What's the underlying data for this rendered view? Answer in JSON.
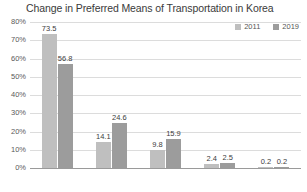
{
  "chart_data": {
    "type": "bar",
    "title": "Change in Preferred Means of Transportation in Korea",
    "xlabel": "",
    "ylabel": "",
    "categories": [
      "Car",
      "Bus",
      "Train",
      "Airplane",
      "Ship"
    ],
    "series": [
      {
        "name": "2011",
        "color": "#bfbfbf",
        "values": [
          73.5,
          14.1,
          9.8,
          2.4,
          0.2
        ]
      },
      {
        "name": "2019",
        "color": "#9c9c9c",
        "values": [
          56.8,
          24.6,
          15.9,
          2.5,
          0.2
        ]
      }
    ],
    "ylim": [
      0,
      80
    ],
    "yticks": [
      "0%",
      "10%",
      "20%",
      "30%",
      "40%",
      "50%",
      "60%",
      "70%",
      "80%"
    ],
    "ytick_values": [
      0,
      10,
      20,
      30,
      40,
      50,
      60,
      70,
      80
    ],
    "grid": true,
    "legend_position": "top-right",
    "value_labels": true
  }
}
